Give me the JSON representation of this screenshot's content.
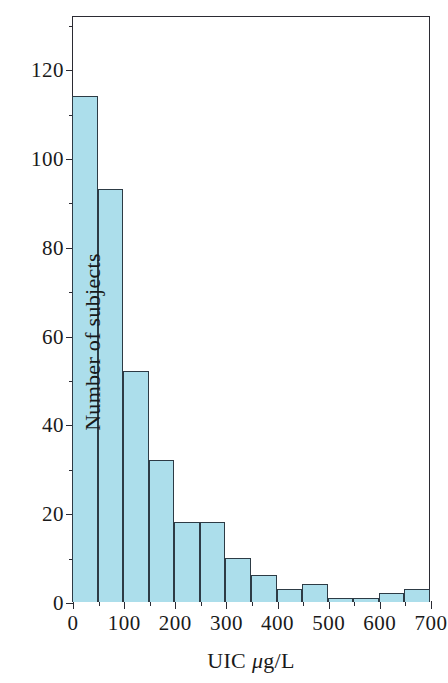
{
  "chart_data": {
    "type": "bar",
    "subtype": "histogram",
    "title": "",
    "xlabel": "UIC μg/L",
    "ylabel": "Number of subjects",
    "xlim": [
      0,
      700
    ],
    "ylim": [
      0,
      132
    ],
    "bin_width": 50,
    "grid": false,
    "legend": null,
    "bar_fill_color": "#ACDEEB",
    "bar_border_color": "#2D3B45",
    "axis_color": "#2B2B33",
    "categories": [
      "0-50",
      "50-100",
      "100-150",
      "150-200",
      "200-250",
      "250-300",
      "300-350",
      "350-400",
      "400-450",
      "450-500",
      "500-550",
      "550-600",
      "600-650",
      "650-700"
    ],
    "bin_edges": [
      0,
      50,
      100,
      150,
      200,
      250,
      300,
      350,
      400,
      450,
      500,
      550,
      600,
      650,
      700
    ],
    "values": [
      114,
      93,
      52,
      32,
      18,
      18,
      10,
      6,
      3,
      4,
      1,
      1,
      2,
      3
    ],
    "x_ticks_major": [
      0,
      100,
      200,
      300,
      400,
      500,
      600,
      700
    ],
    "x_ticks_major_labels": [
      "0",
      "100",
      "200",
      "300",
      "400",
      "500",
      "600",
      "700"
    ],
    "x_ticks_minor": [
      50,
      150,
      250,
      350,
      450,
      550,
      650
    ],
    "y_ticks_major": [
      0,
      20,
      40,
      60,
      80,
      100,
      120
    ],
    "y_ticks_major_labels": [
      "0",
      "20",
      "40",
      "60",
      "80",
      "100",
      "120"
    ],
    "y_ticks_minor": [
      10,
      30,
      50,
      70,
      90,
      110,
      130
    ]
  }
}
